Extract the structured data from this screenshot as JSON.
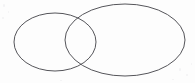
{
  "figure": {
    "kind": "venn-diagram",
    "canvas": {
      "width": 195,
      "height": 83,
      "background_color": "#fdfdfd"
    },
    "style": {
      "stroke_color": "#55555a",
      "stroke_width": 1,
      "fill": "none"
    },
    "shapes": [
      {
        "name": "left-ellipse",
        "role": "set-a",
        "center_x": 55,
        "center_y": 42,
        "radius_x": 41,
        "radius_y": 29,
        "label": ""
      },
      {
        "name": "right-ellipse",
        "role": "set-b",
        "center_x": 125,
        "center_y": 40,
        "radius_x": 60,
        "radius_y": 36,
        "label": ""
      }
    ],
    "intersection": {
      "name": "overlap-lens",
      "upper_point_x": 78,
      "upper_point_y": 15,
      "lower_point_x": 78,
      "lower_point_y": 67,
      "label": ""
    },
    "labels": []
  },
  "chart_data": {
    "type": "diagram",
    "series": [
      {
        "name": "left-ellipse",
        "cx": 55,
        "cy": 42,
        "rx": 41,
        "ry": 29
      },
      {
        "name": "right-ellipse",
        "cx": 125,
        "cy": 40,
        "rx": 60,
        "ry": 36
      }
    ],
    "legend": [],
    "grid": false
  }
}
